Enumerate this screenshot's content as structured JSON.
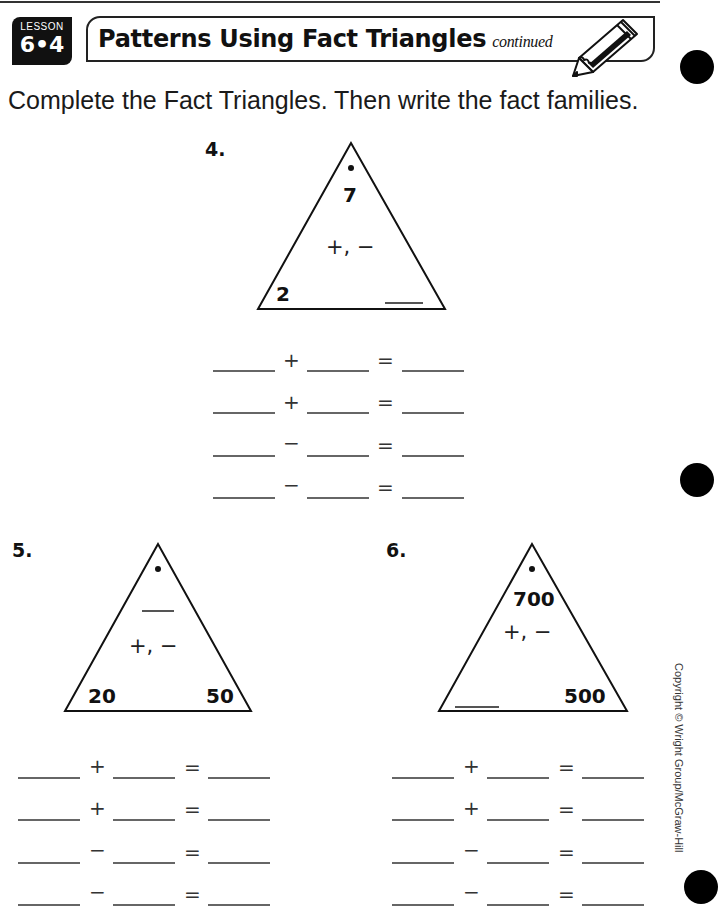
{
  "header": {
    "lesson_word": "LESSON",
    "lesson_number": "6•4",
    "title": "Patterns Using Fact Triangles",
    "title_suffix": "continued",
    "pencil_icon": "pencil-icon"
  },
  "instructions": "Complete the Fact Triangles. Then write the fact families.",
  "problems": [
    {
      "number": "4.",
      "triangle": {
        "top": "7",
        "bottom_left": "2",
        "bottom_right": "____",
        "operations": "+, −"
      },
      "fact_family": [
        {
          "op": "+",
          "eq": "="
        },
        {
          "op": "+",
          "eq": "="
        },
        {
          "op": "−",
          "eq": "="
        },
        {
          "op": "−",
          "eq": "="
        }
      ]
    },
    {
      "number": "5.",
      "triangle": {
        "top": "____",
        "bottom_left": "20",
        "bottom_right": "50",
        "operations": "+, −"
      },
      "fact_family": [
        {
          "op": "+",
          "eq": "="
        },
        {
          "op": "+",
          "eq": "="
        },
        {
          "op": "−",
          "eq": "="
        },
        {
          "op": "−",
          "eq": "="
        }
      ]
    },
    {
      "number": "6.",
      "triangle": {
        "top": "700",
        "bottom_left": "____",
        "bottom_right": "500",
        "operations": "+, −"
      },
      "fact_family": [
        {
          "op": "+",
          "eq": "="
        },
        {
          "op": "+",
          "eq": "="
        },
        {
          "op": "−",
          "eq": "="
        },
        {
          "op": "−",
          "eq": "="
        }
      ]
    }
  ],
  "copyright": "Copyright © Wright Group/McGraw-Hill"
}
